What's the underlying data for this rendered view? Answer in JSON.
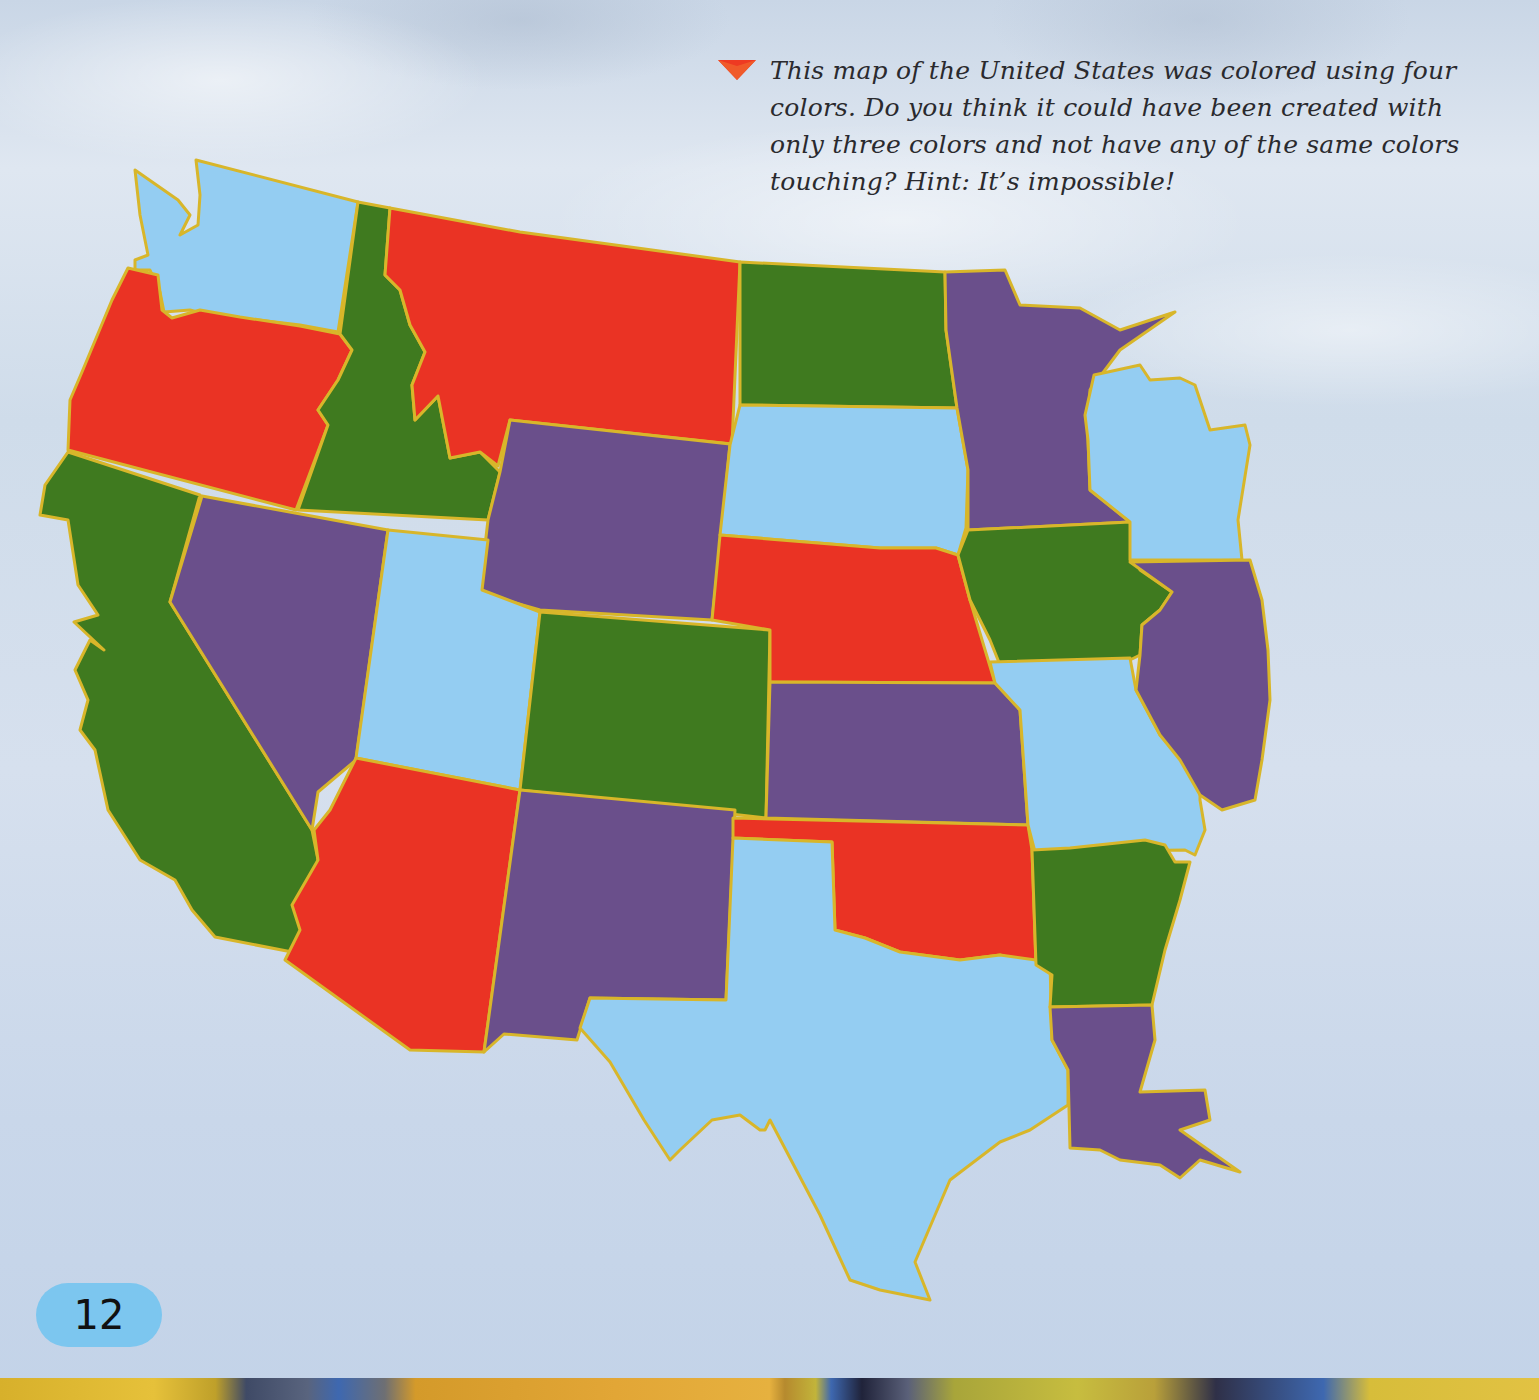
{
  "caption": {
    "marker_icon": "red-triangle-pointer",
    "text": "This map of the United States was colored using four colors. Do you think it could have been created with only three colors and not have any of the same colors touching? Hint: It’s impossible!"
  },
  "page_number": "12",
  "map": {
    "title": "United States four-color map",
    "colors": {
      "red": "#ea3324",
      "green": "#3f7a1f",
      "purple": "#6a4f8b",
      "light_blue": "#94cdf2",
      "border": "#d8b62a"
    },
    "states": [
      {
        "name": "Washington",
        "color": "light_blue"
      },
      {
        "name": "Oregon",
        "color": "red"
      },
      {
        "name": "California",
        "color": "green"
      },
      {
        "name": "Idaho",
        "color": "green"
      },
      {
        "name": "Nevada",
        "color": "purple"
      },
      {
        "name": "Montana",
        "color": "red"
      },
      {
        "name": "Wyoming",
        "color": "purple"
      },
      {
        "name": "Utah",
        "color": "light_blue"
      },
      {
        "name": "Arizona",
        "color": "red"
      },
      {
        "name": "Colorado",
        "color": "green"
      },
      {
        "name": "New Mexico",
        "color": "purple"
      },
      {
        "name": "North Dakota",
        "color": "green"
      },
      {
        "name": "South Dakota",
        "color": "light_blue"
      },
      {
        "name": "Nebraska",
        "color": "red"
      },
      {
        "name": "Kansas",
        "color": "purple"
      },
      {
        "name": "Oklahoma",
        "color": "red"
      },
      {
        "name": "Texas",
        "color": "light_blue"
      },
      {
        "name": "Minnesota",
        "color": "purple"
      },
      {
        "name": "Iowa",
        "color": "green"
      },
      {
        "name": "Missouri",
        "color": "light_blue"
      },
      {
        "name": "Arkansas",
        "color": "green"
      },
      {
        "name": "Louisiana",
        "color": "purple"
      },
      {
        "name": "Wisconsin",
        "color": "light_blue"
      },
      {
        "name": "Illinois",
        "color": "purple"
      },
      {
        "name": "Michigan",
        "color": "red"
      },
      {
        "name": "Indiana",
        "color": "green"
      },
      {
        "name": "Ohio",
        "color": "light_blue"
      },
      {
        "name": "Kentucky",
        "color": "red"
      },
      {
        "name": "Tennessee",
        "color": "purple"
      },
      {
        "name": "Mississippi",
        "color": "red"
      },
      {
        "name": "Alabama",
        "color": "light_blue"
      },
      {
        "name": "Georgia",
        "color": "red"
      },
      {
        "name": "Florida",
        "color": "green"
      },
      {
        "name": "South Carolina",
        "color": "light_blue"
      },
      {
        "name": "North Carolina",
        "color": "green"
      },
      {
        "name": "Virginia",
        "color": "light_blue"
      },
      {
        "name": "West Virginia",
        "color": "purple"
      },
      {
        "name": "Pennsylvania",
        "color": "green"
      }
    ]
  }
}
